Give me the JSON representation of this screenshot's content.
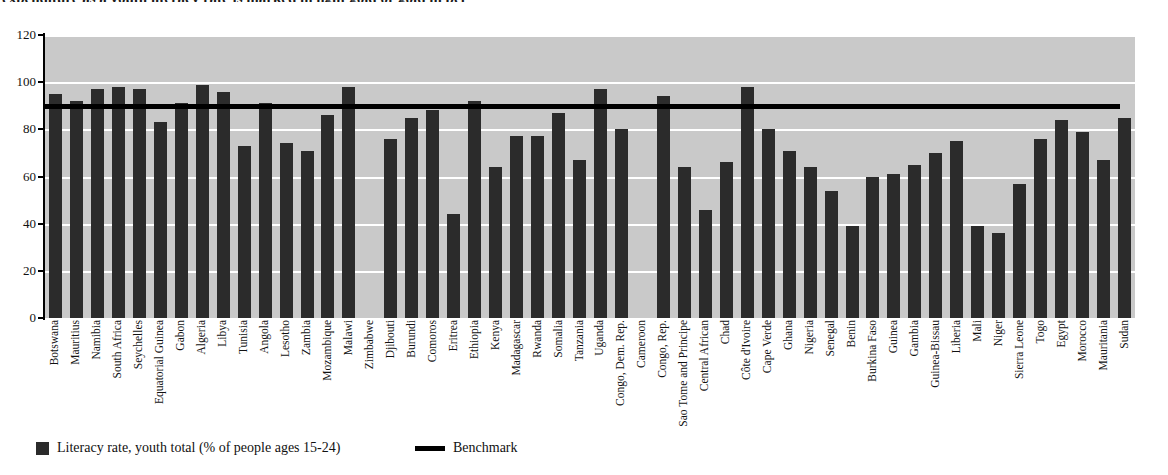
{
  "title": "expenditure as a youth literacy rate is marked in light gold or gold in per",
  "chart_data": {
    "type": "bar",
    "title": "",
    "xlabel": "",
    "ylabel": "",
    "ylim": [
      0,
      120
    ],
    "ytick_step": 20,
    "yticks": [
      0,
      20,
      40,
      60,
      80,
      100,
      120
    ],
    "grid": true,
    "legend_position": "bottom-left",
    "plot_background": "#c9c9c9",
    "bar_color": "#2b2b2b",
    "benchmark_color": "#000000",
    "benchmark_value": 90,
    "series_name": "Literacy rate, youth total (% of people ages 15-24)",
    "benchmark_name": "Benchmark",
    "categories": [
      "Botswana",
      "Mauritius",
      "Namibia",
      "South Africa",
      "Seychelles",
      "Equatorial Guinea",
      "Gabon",
      "Algeria",
      "Libya",
      "Tunisia",
      "Angola",
      "Lesotho",
      "Zambia",
      "Mozambique",
      "Malawi",
      "Zimbabwe",
      "Djibouti",
      "Burundi",
      "Comoros",
      "Eritrea",
      "Ethiopia",
      "Kenya",
      "Madagascar",
      "Rwanda",
      "Somalia",
      "Tanzania",
      "Uganda",
      "Congo, Dem. Rep.",
      "Cameroon",
      "Congo, Rep.",
      "Sao Tome and Principe",
      "Central African",
      "Chad",
      "Côte d'Ivoire",
      "Cape Verde",
      "Ghana",
      "Nigeria",
      "Senegal",
      "Benin",
      "Burkina Faso",
      "Guinea",
      "Gambia",
      "Guinea-Bissau",
      "Liberia",
      "Mali",
      "Niger",
      "Sierra Leone",
      "Togo",
      "Egypt",
      "Morocco",
      "Mauritania",
      "Sudan"
    ],
    "values": [
      95,
      92,
      97,
      98,
      97,
      83,
      91,
      99,
      96,
      73,
      91,
      74,
      71,
      86,
      98,
      null,
      76,
      85,
      88,
      44,
      92,
      64,
      77,
      77,
      87,
      67,
      97,
      80,
      null,
      94,
      64,
      46,
      66,
      98,
      80,
      71,
      64,
      54,
      39,
      60,
      61,
      65,
      70,
      75,
      39,
      36,
      57,
      76,
      84,
      79,
      67,
      85
    ]
  },
  "legend": {
    "series_label": "Literacy rate, youth total (% of people ages 15-24)",
    "benchmark_label": "Benchmark",
    "series_swatch": "bar-swatch-icon",
    "benchmark_swatch": "line-swatch-icon"
  }
}
